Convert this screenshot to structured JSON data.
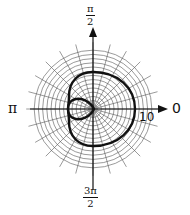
{
  "diagram": {
    "type": "polar-graph",
    "curve_name": "limacon-with-inner-loop",
    "center_px": [
      93,
      109
    ],
    "unit_px": 4.2,
    "ring_count": 14,
    "spoke_count": 24,
    "colors": {
      "grid": "#555555",
      "axis": "#111111",
      "curve": "#111111",
      "background": "#ffffff"
    }
  },
  "labels": {
    "top": {
      "num": "π",
      "den": "2"
    },
    "bottom": {
      "num": "3π",
      "den": "2"
    },
    "left": "π",
    "right": "0",
    "tick_10": "10"
  },
  "chart_data": {
    "type": "polar",
    "title": "",
    "angle_labels": [
      "0",
      "π/2",
      "π",
      "3π/2"
    ],
    "radial_tick_labels": [
      "10"
    ],
    "grid": true,
    "rings": 14,
    "curve_points_xy": [
      [
        10,
        0
      ],
      [
        8.5,
        5.5
      ],
      [
        5,
        8.2
      ],
      [
        0,
        8.8
      ],
      [
        -4,
        7.2
      ],
      [
        -5.7,
        3.5
      ],
      [
        -6,
        0
      ],
      [
        -5.7,
        -3.5
      ],
      [
        -4,
        -7.2
      ],
      [
        0,
        -8.8
      ],
      [
        5,
        -8.2
      ],
      [
        8.5,
        -5.5
      ],
      [
        10,
        0
      ]
    ],
    "inner_loop_points_xy": [
      [
        0,
        0
      ],
      [
        -2,
        2.4
      ],
      [
        -4.5,
        2.4
      ],
      [
        -6,
        0
      ],
      [
        -4.5,
        -2.4
      ],
      [
        -2,
        -2.4
      ],
      [
        0,
        0
      ]
    ]
  }
}
